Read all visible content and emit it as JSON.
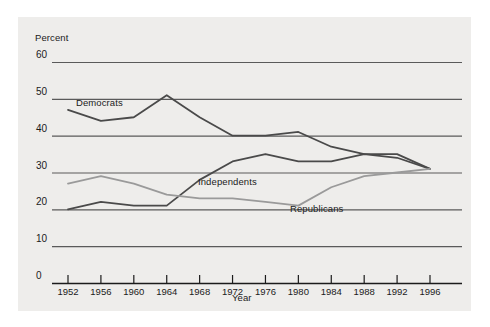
{
  "chart_data": {
    "type": "line",
    "title": "",
    "xlabel": "Year",
    "ylabel": "Percent",
    "ylim": [
      0,
      60
    ],
    "xlim": [
      1952,
      1996
    ],
    "grid": true,
    "legend_position": "inline-annotations",
    "ytick_labels": [
      "60",
      "50",
      "40",
      "30",
      "20",
      "10",
      "0"
    ],
    "ytick_values": [
      60,
      50,
      40,
      30,
      20,
      10,
      0
    ],
    "xtick_labels": [
      "1952",
      "1956",
      "1960",
      "1964",
      "1968",
      "1972",
      "1976",
      "1980",
      "1984",
      "1988",
      "1992",
      "1996"
    ],
    "x": [
      1952,
      1956,
      1960,
      1964,
      1968,
      1972,
      1976,
      1980,
      1984,
      1988,
      1992,
      1996
    ],
    "series": [
      {
        "name": "Democrats",
        "color": "#4a4a4a",
        "values": [
          47,
          44,
          45,
          51,
          45,
          40,
          40,
          41,
          37,
          35,
          35,
          31
        ]
      },
      {
        "name": "Independents",
        "color": "#4a4a4a",
        "values": [
          20,
          22,
          21,
          21,
          28,
          33,
          35,
          33,
          33,
          35,
          34,
          31
        ]
      },
      {
        "name": "Republicans",
        "color": "#9a9a9a",
        "values": [
          27,
          29,
          27,
          24,
          23,
          23,
          22,
          21,
          26,
          29,
          30,
          31
        ]
      }
    ]
  },
  "axis": {
    "ylabel_text": "Percent",
    "xlabel_text": "Year"
  },
  "annotations": {
    "democrats": "Democrats",
    "independents": "Independents",
    "republicans": "Republicans"
  },
  "colors": {
    "panel_background": "#eeedeb",
    "gridline": "#5a5a5a",
    "axis": "#1b1b1b",
    "dark_series": "#4a4a4a",
    "light_series": "#9a9a9a"
  }
}
